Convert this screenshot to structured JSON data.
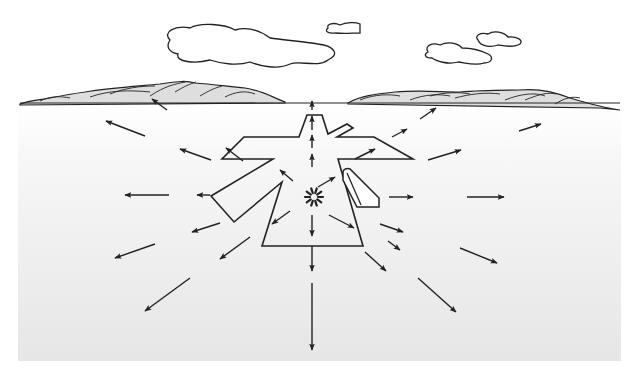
{
  "diagram": {
    "width": 633,
    "height": 368,
    "colors": {
      "sky": "#ffffff",
      "ground_top": "#ffffff",
      "ground_bottom": "#e6e6e6",
      "line": "#222222",
      "hill_fill": "#dedede"
    },
    "ground_rect": {
      "x": 18,
      "y": 103,
      "w": 603,
      "h": 258
    },
    "horizon_y": 103,
    "clouds": [
      {
        "name": "cloud-large",
        "d": "M170 40 C 162 32, 175 25, 190 28 C 200 22, 225 24, 235 30 C 250 26, 262 32, 270 38 C 285 40, 305 42, 318 44 C 335 46, 340 55, 328 60 C 318 68, 300 60, 290 64 C 278 70, 260 66, 250 62 C 238 66, 222 64, 210 60 C 195 64, 175 62, 178 54 C 168 52, 166 46, 170 40 Z"
      },
      {
        "name": "cloud-small-top",
        "d": "M328 28 C 326 24, 334 22, 340 25 C 346 22, 356 22, 360 24 L 360 33 C 352 33, 344 34, 336 33 C 328 34, 324 31, 328 28 Z"
      },
      {
        "name": "cloud-right-lower",
        "d": "M428 52 C 424 46, 432 42, 440 45 C 448 41, 458 43, 462 48 C 470 48, 480 50, 488 54 C 494 57, 492 63, 484 63 C 476 66, 466 63, 458 62 C 448 65, 436 61, 432 58 C 424 58, 424 54, 428 52 Z"
      },
      {
        "name": "cloud-right-upper",
        "d": "M478 40 C 474 36, 480 32, 488 34 C 494 30, 504 32, 508 37 C 516 36, 524 40, 520 44 C 514 48, 504 46, 498 45 C 490 48, 480 46, 478 40 Z"
      }
    ],
    "hills": [
      {
        "name": "hill-left",
        "d": "M20 104 C 30 100, 40 100, 50 98 C 60 96, 70 94, 85 92 C 110 88, 140 86, 160 84 C 175 82, 185 80, 195 83 C 210 84, 225 86, 245 88 C 260 90, 270 96, 285 102 L 285 103 L 20 105 Z",
        "ridges": [
          "M40 101 C 50 96, 60 96, 70 98",
          "M90 97 C 110 90, 130 90, 150 92",
          "M150 96 C 165 86, 175 84, 185 82",
          "M175 92 C 185 86, 190 84, 196 82",
          "M200 96 C 210 90, 215 88, 222 86",
          "M225 97 C 235 92, 245 90, 255 94",
          "M110 94 C 125 88, 140 86, 155 86"
        ]
      },
      {
        "name": "hill-right",
        "d": "M348 103 C 360 96, 375 94, 395 92 C 420 90, 440 92, 460 92 C 480 90, 500 90, 520 90 C 540 88, 555 92, 570 98 C 590 104, 605 108, 620 110 L 600 108 L 348 104 Z",
        "ridges": [
          "M360 100 C 375 94, 390 94, 400 96",
          "M410 100 C 425 94, 440 94, 450 96",
          "M455 98 C 470 94, 485 92, 500 94",
          "M505 100 C 520 94, 535 92, 545 96",
          "M525 100 C 540 94, 548 92, 556 94",
          "M555 104 C 565 98, 572 96, 580 98",
          "M430 96 C 445 92, 460 92, 470 94"
        ]
      }
    ],
    "airport_outline": {
      "name": "airport-runway-outline",
      "points": "307,115 322,115 328,134 347,124 353,128 337,137 374,137 413,159 338,159 363,246 262,246 282,182 234,222 211,196 273,159 222,159 244,137 299,137"
    },
    "building": {
      "name": "terminal-building",
      "body": "M343 172 C 343 169, 347 168, 350 169 L 379 198 L 379 207 L 357 207 L 343 180 Z",
      "inner_line": "M347 173 L 361 205"
    },
    "burst": {
      "cx": 314,
      "cy": 197,
      "r_in": 4,
      "r_out": 9,
      "rays": 10
    },
    "arrows": [
      {
        "x1": 145,
        "y1": 136,
        "x2": 106,
        "y2": 121
      },
      {
        "x1": 211,
        "y1": 160,
        "x2": 180,
        "y2": 149
      },
      {
        "x1": 243,
        "y1": 161,
        "x2": 226,
        "y2": 148
      },
      {
        "x1": 293,
        "y1": 181,
        "x2": 280,
        "y2": 170
      },
      {
        "x1": 210,
        "y1": 195,
        "x2": 197,
        "y2": 195
      },
      {
        "x1": 169,
        "y1": 195,
        "x2": 125,
        "y2": 195
      },
      {
        "x1": 220,
        "y1": 223,
        "x2": 192,
        "y2": 232
      },
      {
        "x1": 290,
        "y1": 211,
        "x2": 272,
        "y2": 224
      },
      {
        "x1": 155,
        "y1": 244,
        "x2": 115,
        "y2": 258
      },
      {
        "x1": 250,
        "y1": 237,
        "x2": 220,
        "y2": 259
      },
      {
        "x1": 190,
        "y1": 278,
        "x2": 145,
        "y2": 311
      },
      {
        "x1": 167,
        "y1": 110,
        "x2": 152,
        "y2": 99
      },
      {
        "x1": 312,
        "y1": 110,
        "x2": 312,
        "y2": 101
      },
      {
        "x1": 312,
        "y1": 130,
        "x2": 312,
        "y2": 116
      },
      {
        "x1": 312,
        "y1": 148,
        "x2": 312,
        "y2": 135
      },
      {
        "x1": 312,
        "y1": 167,
        "x2": 312,
        "y2": 154
      },
      {
        "x1": 312,
        "y1": 215,
        "x2": 312,
        "y2": 236
      },
      {
        "x1": 312,
        "y1": 246,
        "x2": 312,
        "y2": 271
      },
      {
        "x1": 312,
        "y1": 283,
        "x2": 312,
        "y2": 350
      },
      {
        "x1": 318,
        "y1": 187,
        "x2": 335,
        "y2": 177
      },
      {
        "x1": 355,
        "y1": 159,
        "x2": 375,
        "y2": 149
      },
      {
        "x1": 392,
        "y1": 137,
        "x2": 407,
        "y2": 129
      },
      {
        "x1": 420,
        "y1": 119,
        "x2": 436,
        "y2": 108
      },
      {
        "x1": 428,
        "y1": 160,
        "x2": 461,
        "y2": 150
      },
      {
        "x1": 519,
        "y1": 131,
        "x2": 541,
        "y2": 124
      },
      {
        "x1": 389,
        "y1": 197,
        "x2": 413,
        "y2": 197
      },
      {
        "x1": 467,
        "y1": 197,
        "x2": 504,
        "y2": 197
      },
      {
        "x1": 329,
        "y1": 215,
        "x2": 354,
        "y2": 228
      },
      {
        "x1": 380,
        "y1": 224,
        "x2": 403,
        "y2": 232
      },
      {
        "x1": 388,
        "y1": 241,
        "x2": 400,
        "y2": 250
      },
      {
        "x1": 460,
        "y1": 248,
        "x2": 497,
        "y2": 263
      },
      {
        "x1": 365,
        "y1": 252,
        "x2": 386,
        "y2": 271
      },
      {
        "x1": 418,
        "y1": 278,
        "x2": 456,
        "y2": 312
      }
    ]
  }
}
